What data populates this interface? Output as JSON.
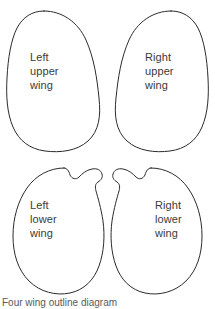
{
  "figure": {
    "background_color": "#ffffff",
    "outline_color": "#2b2b2b",
    "label_color": "#3a3a3a",
    "wings": [
      {
        "id": "left-upper",
        "label": "Left\nupper\nwing",
        "label_lines": [
          "Left",
          "upper",
          "wing"
        ],
        "side": "Left",
        "position": "upper",
        "shape": "rounded elongated lobe"
      },
      {
        "id": "right-upper",
        "label": "Right\nupper\nwing",
        "label_lines": [
          "Right",
          "upper",
          "wing"
        ],
        "side": "Right",
        "position": "upper",
        "shape": "rounded elongated lobe"
      },
      {
        "id": "left-lower",
        "label": "Left\nlower\nwing",
        "label_lines": [
          "Left",
          "lower",
          "wing"
        ],
        "side": "Left",
        "position": "lower",
        "shape": "kidney lobe with inner notch"
      },
      {
        "id": "right-lower",
        "label": "Right\nlower\nwing",
        "label_lines": [
          "Right",
          "lower",
          "wing"
        ],
        "side": "Right",
        "position": "lower",
        "shape": "kidney lobe with inner notch"
      }
    ],
    "caption_clipped": "Four wing outline diagram"
  }
}
